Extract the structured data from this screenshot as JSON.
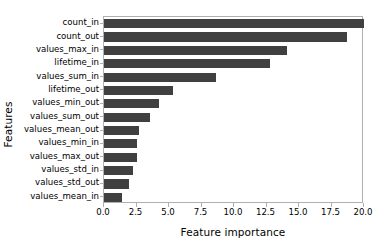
{
  "chart_data": {
    "type": "bar",
    "orientation": "horizontal",
    "title": "",
    "xlabel": "Feature importance",
    "ylabel": "Features",
    "xlim": [
      0.0,
      20.0
    ],
    "xticks": [
      "0.0",
      "2.5",
      "5.0",
      "7.5",
      "10.0",
      "12.5",
      "15.0",
      "17.5",
      "20.0"
    ],
    "xtick_values": [
      0.0,
      2.5,
      5.0,
      7.5,
      10.0,
      12.5,
      15.0,
      17.5,
      20.0
    ],
    "grid": false,
    "legend": null,
    "bar_color": "#404040",
    "categories": [
      "count_in",
      "count_out",
      "values_max_in",
      "lifetime_in",
      "values_sum_in",
      "lifetime_out",
      "values_min_out",
      "values_sum_out",
      "values_mean_out",
      "values_min_in",
      "values_max_out",
      "values_std_in",
      "values_std_out",
      "values_mean_in"
    ],
    "values": [
      20.0,
      18.7,
      14.1,
      12.8,
      8.6,
      5.3,
      4.2,
      3.5,
      2.7,
      2.5,
      2.5,
      2.2,
      1.9,
      1.4
    ]
  }
}
